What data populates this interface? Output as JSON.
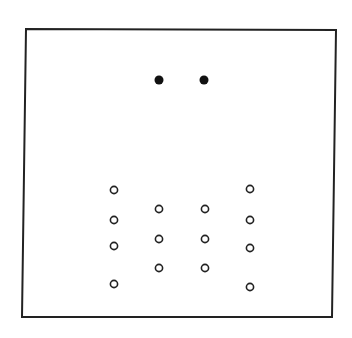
{
  "figure": {
    "width": 352,
    "height": 338,
    "background": "#ffffff",
    "frame": {
      "points": [
        [
          26,
          29
        ],
        [
          336,
          30
        ],
        [
          332,
          317
        ],
        [
          22,
          317
        ]
      ],
      "stroke": "#222222",
      "stroke_width": 2
    },
    "filled_dots": {
      "color": "#111111",
      "radius": 4.5,
      "points": [
        [
          159,
          80
        ],
        [
          204,
          80
        ]
      ]
    },
    "open_circles": {
      "color": "#222222",
      "radius": 3.6,
      "stroke_width": 1.6,
      "columns": [
        {
          "x": 114,
          "ys": [
            190,
            220,
            246,
            284
          ]
        },
        {
          "x": 159,
          "ys": [
            209,
            239,
            268
          ]
        },
        {
          "x": 205,
          "ys": [
            209,
            239,
            268
          ]
        },
        {
          "x": 250,
          "ys": [
            189,
            220,
            248,
            287
          ]
        }
      ]
    }
  }
}
